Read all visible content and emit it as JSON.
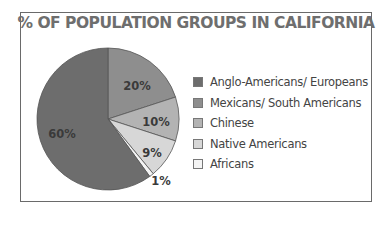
{
  "chart_data": {
    "type": "pie",
    "title": "% OF POPULATION GROUPS IN CALIFORNIA",
    "categories": [
      "Anglo-Americans/ Europeans",
      "Mexicans/ South Americans",
      "Chinese",
      "Native Americans",
      "Africans"
    ],
    "values": [
      60,
      20,
      10,
      9,
      1
    ],
    "labels": [
      "60%",
      "20%",
      "10%",
      "9%",
      "1%"
    ],
    "colors": [
      "#6d6d6d",
      "#8e8e8e",
      "#b3b3b3",
      "#d7d7d7",
      "#f4f4f4"
    ],
    "legend_position": "right"
  },
  "legend": {
    "items": [
      {
        "label": "Anglo-Americans/ Europeans",
        "color": "#6d6d6d"
      },
      {
        "label": "Mexicans/ South Americans",
        "color": "#8e8e8e"
      },
      {
        "label": "Chinese",
        "color": "#b3b3b3"
      },
      {
        "label": "Native Americans",
        "color": "#d7d7d7"
      },
      {
        "label": "Africans",
        "color": "#f4f4f4"
      }
    ]
  }
}
